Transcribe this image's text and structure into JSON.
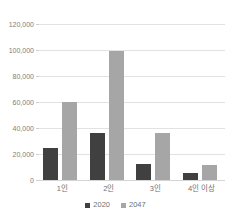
{
  "chart_data": {
    "type": "bar",
    "title": "",
    "xlabel": "",
    "ylabel": "",
    "categories": [
      "1인",
      "2인",
      "3인",
      "4인 이상"
    ],
    "series": [
      {
        "name": "2020",
        "color": "#404040",
        "values": [
          24500,
          36000,
          12500,
          5500
        ]
      },
      {
        "name": "2047",
        "color": "#a6a6a6",
        "values": [
          60000,
          99000,
          36500,
          11500
        ]
      }
    ],
    "ylim": [
      0,
      120000
    ],
    "ytick_step": 20000,
    "ytick_labels": [
      "120,000",
      "100,000",
      "80,000",
      "60,000",
      "40,000",
      "20,000",
      "0"
    ],
    "ytick_values": [
      120000,
      100000,
      80000,
      60000,
      40000,
      20000,
      0
    ],
    "grid": true,
    "legend_position": "bottom"
  },
  "legend": {
    "entries": [
      {
        "label": "2020",
        "color": "#404040"
      },
      {
        "label": "2047",
        "color": "#a6a6a6"
      }
    ]
  }
}
